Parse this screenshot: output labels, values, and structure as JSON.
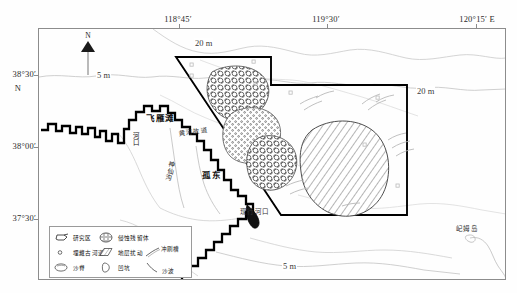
{
  "figure": {
    "kind": "geological-survey-map",
    "region": "Yellow River Delta / Gudong offshore area",
    "background_color": "#fefefe",
    "frame_color": "#8c8c8c",
    "study_area_outline_color": "#000000"
  },
  "axes": {
    "top_labels": [
      {
        "text": "118°45′",
        "x_px": 178
      },
      {
        "text": "119°30′",
        "x_px": 326
      },
      {
        "text": "120°15′ E",
        "x_px": 477
      }
    ],
    "left_labels": [
      {
        "text": "38°30′",
        "y_px": 74
      },
      {
        "text": "N",
        "y_px": 89
      },
      {
        "text": "38°00′",
        "y_px": 146
      },
      {
        "text": "37°30′",
        "y_px": 218
      }
    ]
  },
  "north_arrow": {
    "label": "N"
  },
  "depth_contours": [
    {
      "label": "5 m",
      "x_px": 103,
      "y_px": 76
    },
    {
      "label": "20 m",
      "x_px": 206,
      "y_px": 44
    },
    {
      "label": "20 m",
      "x_px": 428,
      "y_px": 92
    },
    {
      "label": "5 m",
      "x_px": 291,
      "y_px": 267
    }
  ],
  "place_labels": [
    {
      "text": "飞雁滩",
      "x_px": 152,
      "y_px": 117,
      "style": "cn"
    },
    {
      "text": "黄河故道",
      "x_px": 186,
      "y_px": 131,
      "style": "cn-small"
    },
    {
      "text": "孤东",
      "x_px": 208,
      "y_px": 174,
      "style": "cn"
    },
    {
      "text": "现行河口",
      "x_px": 246,
      "y_px": 212,
      "style": "cn-small"
    },
    {
      "text": "屺姆岛",
      "x_px": 464,
      "y_px": 228,
      "style": "cn-small"
    },
    {
      "text": "河口",
      "x_px": 133,
      "y_px": 140,
      "style": "vert"
    },
    {
      "text": "神仙沟",
      "x_px": 168,
      "y_px": 168,
      "style": "vert"
    }
  ],
  "legend": {
    "rows": [
      [
        {
          "symbol": "study-area",
          "label": "研究区"
        },
        {
          "symbol": "erosion-remnant",
          "label": "侵蚀残留体"
        }
      ],
      [
        {
          "symbol": "buried-paleochannel",
          "label": "埋藏古河道"
        },
        {
          "symbol": "strata-disturbance",
          "label": "地层扰动"
        },
        {
          "symbol": "scour-trough",
          "label": "冲刷槽"
        }
      ],
      [
        {
          "symbol": "sand-ridge",
          "label": "沙脊"
        },
        {
          "symbol": "pit",
          "label": "凹坑"
        },
        {
          "symbol": "sand-wave",
          "label": "沙波"
        }
      ]
    ]
  },
  "polygons": [
    {
      "name": "erosion-remnant-north",
      "pattern": "circles-dense"
    },
    {
      "name": "erosion-remnant-mid",
      "pattern": "dots-sparse"
    },
    {
      "name": "erosion-remnant-south",
      "pattern": "circles-dense"
    },
    {
      "name": "strata-disturbance-east",
      "pattern": "diagonal-lines"
    }
  ]
}
